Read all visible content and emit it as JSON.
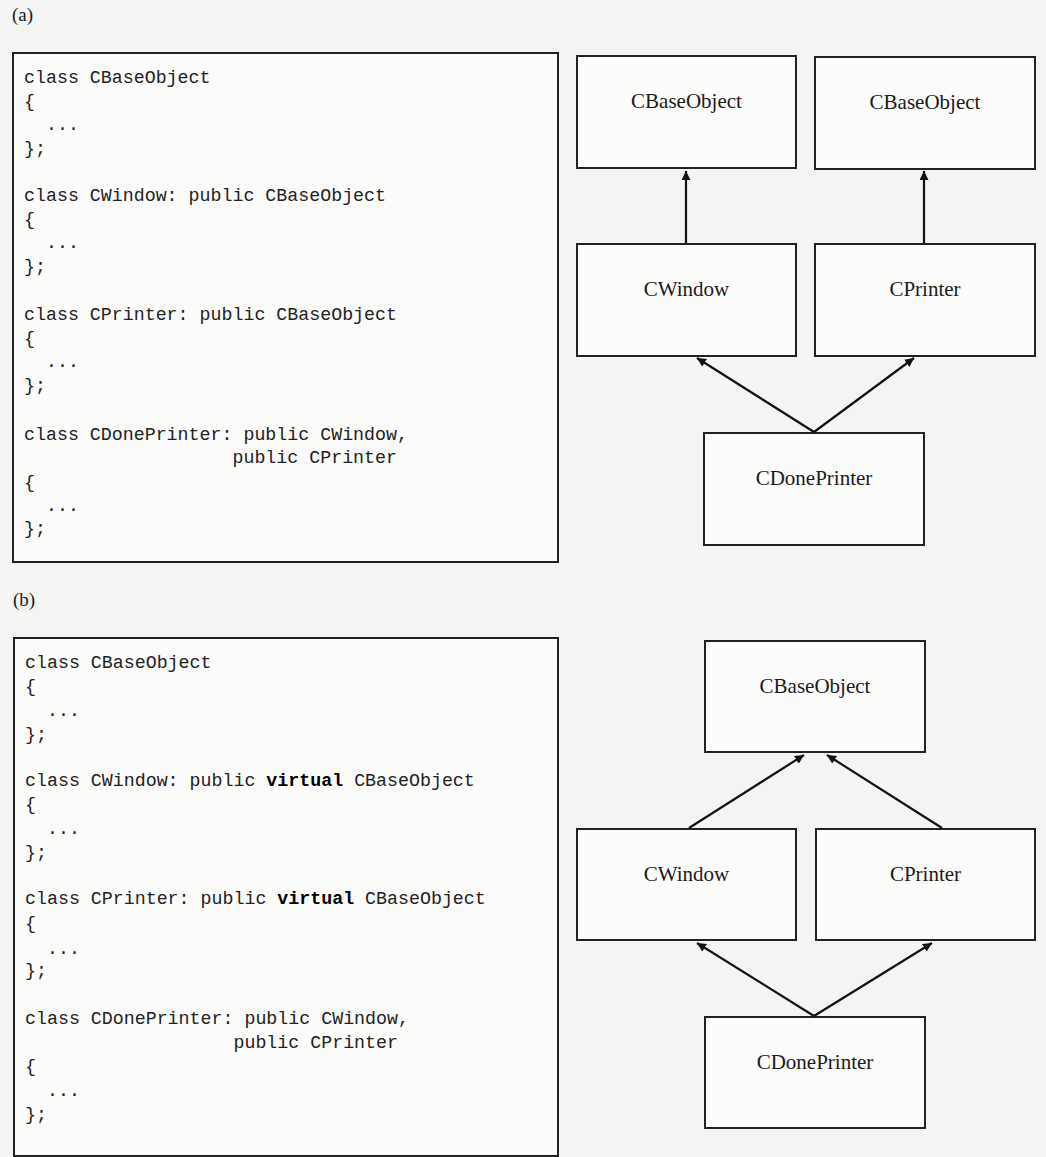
{
  "figure": {
    "panels": [
      {
        "label": "(a)",
        "code": {
          "blocks": [
            {
              "lines": [
                {
                  "pre": "class CBaseObject",
                  "kw": "",
                  "post": ""
                },
                {
                  "pre": "{",
                  "kw": "",
                  "post": ""
                },
                {
                  "pre": "  ...",
                  "kw": "",
                  "post": ""
                },
                {
                  "pre": "};",
                  "kw": "",
                  "post": ""
                }
              ]
            },
            {
              "lines": [
                {
                  "pre": "class CWindow: public CBaseObject",
                  "kw": "",
                  "post": ""
                },
                {
                  "pre": "{",
                  "kw": "",
                  "post": ""
                },
                {
                  "pre": "  ...",
                  "kw": "",
                  "post": ""
                },
                {
                  "pre": "};",
                  "kw": "",
                  "post": ""
                }
              ]
            },
            {
              "lines": [
                {
                  "pre": "class CPrinter: public CBaseObject",
                  "kw": "",
                  "post": ""
                },
                {
                  "pre": "{",
                  "kw": "",
                  "post": ""
                },
                {
                  "pre": "  ...",
                  "kw": "",
                  "post": ""
                },
                {
                  "pre": "};",
                  "kw": "",
                  "post": ""
                }
              ]
            },
            {
              "lines": [
                {
                  "pre": "class CDonePrinter: public CWindow,",
                  "kw": "",
                  "post": ""
                },
                {
                  "pre": "                   public CPrinter",
                  "kw": "",
                  "post": ""
                },
                {
                  "pre": "{",
                  "kw": "",
                  "post": ""
                },
                {
                  "pre": "  ...",
                  "kw": "",
                  "post": ""
                },
                {
                  "pre": "};",
                  "kw": "",
                  "post": ""
                }
              ]
            }
          ]
        },
        "diagram": {
          "nodes": [
            {
              "id": "a-base-left",
              "label": "CBaseObject"
            },
            {
              "id": "a-base-right",
              "label": "CBaseObject"
            },
            {
              "id": "a-window",
              "label": "CWindow"
            },
            {
              "id": "a-printer",
              "label": "CPrinter"
            },
            {
              "id": "a-done",
              "label": "CDonePrinter"
            }
          ],
          "edges": [
            {
              "from": "CWindow",
              "to": "CBaseObject (left)"
            },
            {
              "from": "CPrinter",
              "to": "CBaseObject (right)"
            },
            {
              "from": "CDonePrinter",
              "to": "CWindow"
            },
            {
              "from": "CDonePrinter",
              "to": "CPrinter"
            }
          ]
        }
      },
      {
        "label": "(b)",
        "code": {
          "blocks": [
            {
              "lines": [
                {
                  "pre": "class CBaseObject",
                  "kw": "",
                  "post": ""
                },
                {
                  "pre": "{",
                  "kw": "",
                  "post": ""
                },
                {
                  "pre": "  ...",
                  "kw": "",
                  "post": ""
                },
                {
                  "pre": "};",
                  "kw": "",
                  "post": ""
                }
              ]
            },
            {
              "lines": [
                {
                  "pre": "class CWindow: public ",
                  "kw": "virtual",
                  "post": " CBaseObject"
                },
                {
                  "pre": "{",
                  "kw": "",
                  "post": ""
                },
                {
                  "pre": "  ...",
                  "kw": "",
                  "post": ""
                },
                {
                  "pre": "};",
                  "kw": "",
                  "post": ""
                }
              ]
            },
            {
              "lines": [
                {
                  "pre": "class CPrinter: public ",
                  "kw": "virtual",
                  "post": " CBaseObject"
                },
                {
                  "pre": "{",
                  "kw": "",
                  "post": ""
                },
                {
                  "pre": "  ...",
                  "kw": "",
                  "post": ""
                },
                {
                  "pre": "};",
                  "kw": "",
                  "post": ""
                }
              ]
            },
            {
              "lines": [
                {
                  "pre": "class CDonePrinter: public CWindow,",
                  "kw": "",
                  "post": ""
                },
                {
                  "pre": "                   public CPrinter",
                  "kw": "",
                  "post": ""
                },
                {
                  "pre": "{",
                  "kw": "",
                  "post": ""
                },
                {
                  "pre": "  ...",
                  "kw": "",
                  "post": ""
                },
                {
                  "pre": "};",
                  "kw": "",
                  "post": ""
                }
              ]
            }
          ]
        },
        "diagram": {
          "nodes": [
            {
              "id": "b-base",
              "label": "CBaseObject"
            },
            {
              "id": "b-window",
              "label": "CWindow"
            },
            {
              "id": "b-printer",
              "label": "CPrinter"
            },
            {
              "id": "b-done",
              "label": "CDonePrinter"
            }
          ],
          "edges": [
            {
              "from": "CWindow",
              "to": "CBaseObject"
            },
            {
              "from": "CPrinter",
              "to": "CBaseObject"
            },
            {
              "from": "CDonePrinter",
              "to": "CWindow"
            },
            {
              "from": "CDonePrinter",
              "to": "CPrinter"
            }
          ]
        }
      }
    ]
  }
}
